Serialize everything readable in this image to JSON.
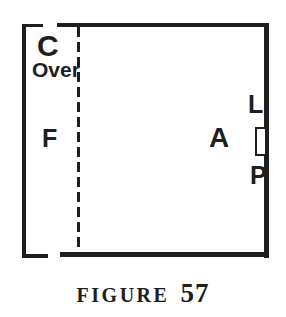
{
  "figure": {
    "caption": {
      "word": "FIGURE",
      "number": "57"
    },
    "labels": {
      "c": {
        "text": "C"
      },
      "over": {
        "text": "Over"
      },
      "f": {
        "text": "F"
      },
      "a": {
        "text": "A"
      },
      "l": {
        "text": "L"
      },
      "p": {
        "text": "P"
      }
    },
    "colors": {
      "ink": "#1e1e1e",
      "background": "#ffffff"
    }
  }
}
